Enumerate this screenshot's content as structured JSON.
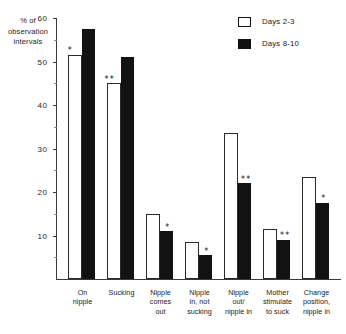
{
  "chart_data": {
    "type": "bar",
    "title": "",
    "xlabel": "",
    "ylabel": "% of observation intervals",
    "ylim": [
      0,
      60
    ],
    "yticks": [
      10,
      20,
      30,
      40,
      50,
      60
    ],
    "grid": false,
    "legend_position": "top-right",
    "categories": [
      "On nipple",
      "Sucking",
      "Nipple comes out",
      "Nipple in, not sucking",
      "Nipple out/ nipple in",
      "Mother stimulate to suck",
      "Change position, nipple in"
    ],
    "series": [
      {
        "name": "Days 2-3",
        "swatch": "open",
        "color": "#ffffff",
        "values": [
          51.5,
          45.0,
          15.0,
          8.5,
          33.5,
          11.5,
          23.5
        ]
      },
      {
        "name": "Days 8-10",
        "swatch": "filled",
        "color": "#121212",
        "values": [
          57.5,
          51.0,
          11.0,
          5.5,
          22.0,
          9.0,
          17.5
        ]
      }
    ],
    "annotations": [
      {
        "category_index": 0,
        "series": "Days 2-3",
        "marker": "*"
      },
      {
        "category_index": 1,
        "series": "Days 2-3",
        "marker": "**"
      },
      {
        "category_index": 2,
        "series": "Days 8-10",
        "marker": "*"
      },
      {
        "category_index": 3,
        "series": "Days 8-10",
        "marker": "*"
      },
      {
        "category_index": 4,
        "series": "Days 8-10",
        "marker": "**"
      },
      {
        "category_index": 5,
        "series": "Days 8-10",
        "marker": "**"
      },
      {
        "category_index": 6,
        "series": "Days 8-10",
        "marker": "*"
      }
    ]
  },
  "axis": {
    "y_title_lines": [
      "% of",
      "observation",
      "intervals"
    ],
    "y_tick_labels": [
      "60",
      "50",
      "40",
      "30",
      "20",
      "10"
    ]
  },
  "legend": {
    "items": [
      {
        "label": "Days 2-3",
        "swatch": "open"
      },
      {
        "label": "Days 8-10",
        "swatch": "filled"
      }
    ]
  },
  "categories_display": [
    [
      "On",
      "nipple"
    ],
    [
      "Sucking"
    ],
    [
      "Nipple",
      "comes",
      "out"
    ],
    [
      "Nipple",
      "in, not",
      "sucking"
    ],
    [
      "Nipple",
      "out/",
      "nipple in"
    ],
    [
      "Mother",
      "stimulate",
      "to suck"
    ],
    [
      "Change",
      "position,",
      "nipple in"
    ]
  ]
}
